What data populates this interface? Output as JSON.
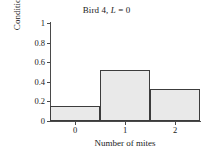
{
  "chart_data": {
    "type": "bar",
    "title": "Bird 4, L = 0",
    "title_parts": {
      "prefix": "Bird 4, ",
      "italic": "L",
      "suffix": " = 0"
    },
    "xlabel": "Number of mites",
    "ylabel": "Conditional probability",
    "categories": [
      "0",
      "1",
      "2"
    ],
    "values": [
      0.15,
      0.52,
      0.33
    ],
    "xlim": [
      -0.5,
      2.5
    ],
    "ylim": [
      0,
      1
    ],
    "ytick_labels": [
      "0",
      "0.2",
      "0.4",
      "0.6",
      "0.8",
      "1"
    ],
    "ytick_values": [
      0,
      0.2,
      0.4,
      0.6,
      0.8,
      1
    ],
    "xtick_labels": [
      "0",
      "1",
      "2"
    ],
    "xtick_values": [
      0,
      1,
      2
    ],
    "grid": false,
    "legend": null,
    "bar_fill_color": "#e9e9e9",
    "bar_edge_color": "#3c3c3c",
    "axis_color": "#4a4a4a",
    "background_color": "#ffffff"
  }
}
